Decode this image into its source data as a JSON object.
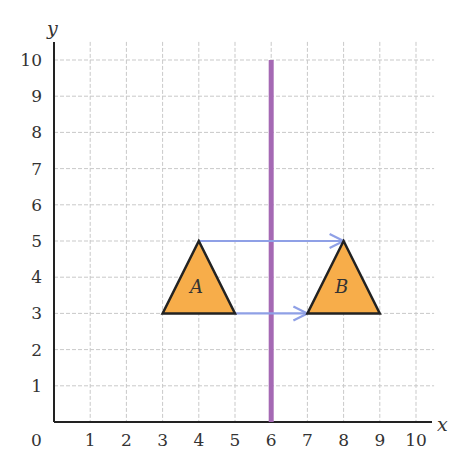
{
  "chart_data": {
    "type": "diagram",
    "xlabel": "x",
    "ylabel": "y",
    "origin_label": "0",
    "x_ticks": [
      "1",
      "2",
      "3",
      "4",
      "5",
      "6",
      "7",
      "8",
      "9",
      "10"
    ],
    "y_ticks": [
      "1",
      "2",
      "3",
      "4",
      "5",
      "6",
      "7",
      "8",
      "9",
      "10"
    ],
    "xlim": [
      0,
      10.5
    ],
    "ylim": [
      0,
      10.5
    ],
    "grid": true,
    "mirror_line": {
      "x": 6,
      "y_from": 0,
      "y_to": 10,
      "color": "#a569b4"
    },
    "shapes": [
      {
        "label": "A",
        "vertices": [
          [
            3,
            3
          ],
          [
            5,
            3
          ],
          [
            4,
            5
          ]
        ],
        "fill": "#f7ad4a",
        "stroke": "#222222"
      },
      {
        "label": "B",
        "vertices": [
          [
            7,
            3
          ],
          [
            9,
            3
          ],
          [
            8,
            5
          ]
        ],
        "fill": "#f7ad4a",
        "stroke": "#222222"
      }
    ],
    "arrows": [
      {
        "from": [
          4,
          5
        ],
        "to": [
          8,
          5
        ],
        "color": "#8fa0e6"
      },
      {
        "from": [
          5,
          3
        ],
        "to": [
          7,
          3
        ],
        "color": "#8fa0e6"
      }
    ]
  },
  "labels": {
    "x_axis": "x",
    "y_axis": "y",
    "origin": "0",
    "shape_a": "A",
    "shape_b": "B",
    "x_ticks": [
      "1",
      "2",
      "3",
      "4",
      "5",
      "6",
      "7",
      "8",
      "9",
      "10"
    ],
    "y_ticks": [
      "1",
      "2",
      "3",
      "4",
      "5",
      "6",
      "7",
      "8",
      "9",
      "10"
    ]
  }
}
